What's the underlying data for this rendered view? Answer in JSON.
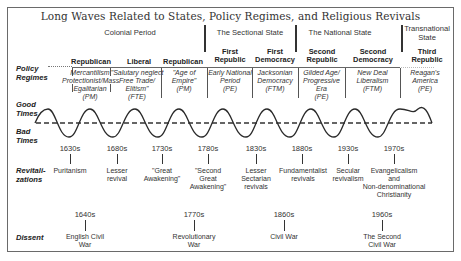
{
  "title": "Long Waves Related to States, Policy Regimes, and Religious Revivals",
  "eras": [
    {
      "label": "Colonial Period"
    },
    {
      "label": "The Sectional State"
    },
    {
      "label": "The National State"
    },
    {
      "label": "Transnational State"
    }
  ],
  "row_labels": {
    "policy_regimes": "Policy Regimes",
    "good_times": "Good Times",
    "bad_times": "Bad Times",
    "revitalizations": "Revitali-zations",
    "dissent": "Dissent"
  },
  "regimes": [
    {
      "name": "Republican",
      "desc": "Mercantilism Protectionist/Mass Egalitarian (PM)"
    },
    {
      "name": "Liberal",
      "desc": "\"Salutary neglect Free Trade/ Elitism\" (FTE)"
    },
    {
      "name": "Republican",
      "desc": "\"Age of Empire\" (PM)"
    },
    {
      "name": "First Republic",
      "desc": "Early National Period (PE)"
    },
    {
      "name": "First Democracy",
      "desc": "Jacksonian Democracy (FTM)"
    },
    {
      "name": "Second Republic",
      "desc": "Gilded Age/ Progressive Era (PE)"
    },
    {
      "name": "Second Democracy",
      "desc": "New Deal Liberalism (FTM)"
    },
    {
      "name": "Third Republic",
      "desc": "Reagan's America (PE)"
    }
  ],
  "revitalizations": [
    {
      "decade": "1630s",
      "event": "Puritanism"
    },
    {
      "decade": "1680s",
      "event": "Lesser revival"
    },
    {
      "decade": "1730s",
      "event": "\"Great Awakening\""
    },
    {
      "decade": "1780s",
      "event": "\"Second Great Awakening\""
    },
    {
      "decade": "1830s",
      "event": "Lesser Sectarian revivals"
    },
    {
      "decade": "1880s",
      "event": "Fundamentalist revivals"
    },
    {
      "decade": "1930s",
      "event": "Secular revivalism"
    },
    {
      "decade": "1970s",
      "event": "Evangelicalism and Non-denominational Christianity"
    }
  ],
  "dissent": [
    {
      "decade": "1640s",
      "event": "English Civil War"
    },
    {
      "decade": "1770s",
      "event": "Revolutionary War"
    },
    {
      "decade": "1860s",
      "event": "Civil War"
    },
    {
      "decade": "1960s",
      "event": "The Second Civil War"
    }
  ],
  "colors": {
    "line": "#2a2a2a",
    "frame": "#6a6a6a",
    "background": "#ffffff"
  }
}
